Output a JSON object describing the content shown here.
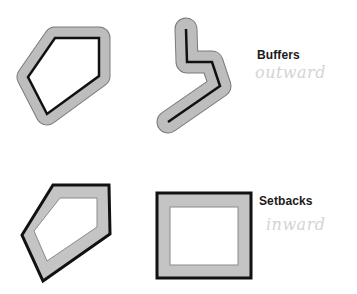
{
  "diagram": {
    "buffers": {
      "title": "Buffers",
      "annotation": "outward"
    },
    "setbacks": {
      "title": "Setbacks",
      "annotation": "inward"
    },
    "colors": {
      "buffer_fill": "#bdbdbd",
      "buffer_edge": "#7a7a7a",
      "line": "#111111",
      "setback_fill": "#c4c4c4",
      "annotation": "#d4d4d4"
    },
    "shapes": [
      {
        "name": "polygon-buffer",
        "type": "polygon",
        "operation": "buffer-outward"
      },
      {
        "name": "line-buffer",
        "type": "polyline",
        "operation": "buffer-outward"
      },
      {
        "name": "polygon-setback",
        "type": "polygon",
        "operation": "setback-inward"
      },
      {
        "name": "rectangle-setback",
        "type": "rectangle",
        "operation": "setback-inward"
      }
    ]
  }
}
